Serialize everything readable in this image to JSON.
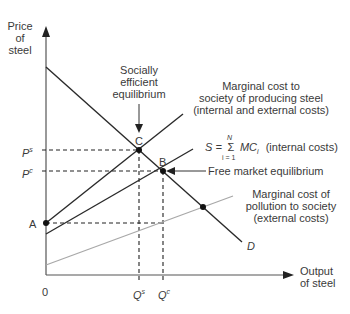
{
  "diagram": {
    "y_axis_label": [
      "Price",
      "of",
      "steel"
    ],
    "x_axis_label": [
      "Output",
      "of steel"
    ],
    "origin_label": "0",
    "points": {
      "A": "A",
      "B": "B",
      "C": "C"
    },
    "price_ticks": {
      "ps_main": "P",
      "ps_sup": "s",
      "pc_main": "P",
      "pc_sup": "c"
    },
    "quantity_ticks": {
      "qs_main": "Q",
      "qs_sup": "s",
      "qc_main": "Q",
      "qc_sup": "c"
    },
    "annotations": {
      "socially_efficient": [
        "Socially",
        "efficient",
        "equilibrium"
      ],
      "marginal_cost_society": [
        "Marginal cost to",
        "society of producing steel",
        "(internal and external costs)"
      ],
      "supply_formula": {
        "lhs": "S =",
        "sigma": "Σ",
        "upper": "N",
        "lower": "i = 1",
        "term": "MC",
        "sub": "i",
        "suffix": "(internal costs)"
      },
      "free_market": "Free market  equilibrium",
      "pollution_cost": [
        "Marginal cost of",
        "pollution to society",
        "(external costs)"
      ],
      "demand": "D"
    },
    "colors": {
      "line": "#2a2a2a",
      "external": "#a8a8a8",
      "text": "#3a3a3a"
    }
  }
}
